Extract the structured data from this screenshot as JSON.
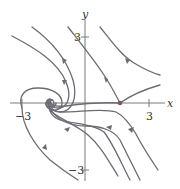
{
  "figure": {
    "type": "phase-portrait",
    "axes": {
      "x_label": "x",
      "y_label": "y",
      "x_ticks": [
        {
          "value": -3,
          "label": "−3"
        },
        {
          "value": 3,
          "label": "3"
        }
      ],
      "y_ticks": [
        {
          "value": 3,
          "label": "3"
        },
        {
          "value": -3,
          "label": "−3"
        }
      ],
      "x_range": [
        -3.5,
        3.5
      ],
      "y_range": [
        -3.5,
        3.8
      ]
    },
    "equilibria": [
      {
        "kind": "saddle",
        "x": 1.6,
        "y": 0,
        "marker": "dot"
      },
      {
        "kind": "spiral-sink",
        "x": -1.6,
        "y": 0
      }
    ],
    "colors": {
      "curve": "#6b6b73",
      "axis": "#7a7a7a",
      "equilibrium_dot": "#7a5a5a"
    }
  }
}
